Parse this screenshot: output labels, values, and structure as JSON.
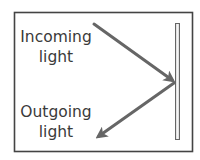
{
  "diagram": {
    "labels": {
      "incoming_line1": "Incoming",
      "incoming_line2": "light",
      "outgoing_line1": "Outgoing",
      "outgoing_line2": "light"
    },
    "elements": {
      "mirror": "mirror",
      "incoming_ray": "incoming light ray",
      "outgoing_ray": "outgoing (reflected) light ray"
    },
    "colors": {
      "frame": "#444444",
      "arrow": "#666666",
      "mirror_edge": "#666666",
      "mirror_fill": "#e8e8e8",
      "text": "#3a3a3a"
    }
  }
}
